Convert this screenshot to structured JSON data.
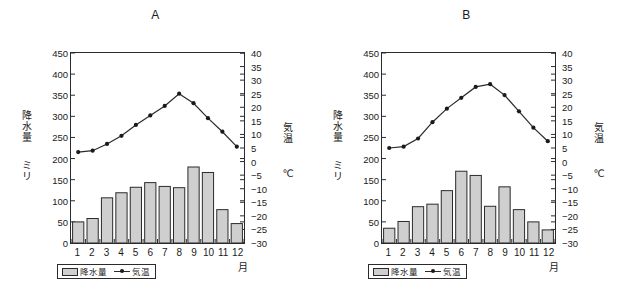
{
  "figure": {
    "xunit_label": "月",
    "legend": {
      "bar_label": "降水量",
      "line_label": "気温"
    },
    "axis_labels": {
      "left_name": "降水量",
      "left_unit": "ミリ",
      "right_name": "気温",
      "right_unit": "℃"
    }
  },
  "chart_data": [
    {
      "type": "bar",
      "title": "A",
      "categories": [
        "1",
        "2",
        "3",
        "4",
        "5",
        "6",
        "7",
        "8",
        "9",
        "10",
        "11",
        "12"
      ],
      "xlabel": "月",
      "ylabel": "降水量",
      "ylim": [
        0,
        450
      ],
      "yticks": [
        0,
        50,
        100,
        150,
        200,
        250,
        300,
        350,
        400,
        450
      ],
      "y2label": "気温",
      "y2lim": [
        -30,
        40
      ],
      "y2ticks": [
        -30,
        -25,
        -20,
        -15,
        -10,
        -5,
        0,
        5,
        10,
        15,
        20,
        25,
        30,
        35,
        40
      ],
      "grid": false,
      "legend_position": "below-axis-left",
      "series": [
        {
          "name": "降水量",
          "kind": "bar",
          "unit": "mm",
          "axis": "left",
          "values": [
            50,
            58,
            107,
            119,
            132,
            143,
            134,
            131,
            180,
            167,
            79,
            46
          ]
        },
        {
          "name": "気温",
          "kind": "line",
          "unit": "℃",
          "axis": "right",
          "values": [
            3.5,
            4.0,
            6.5,
            9.5,
            13.5,
            17.0,
            20.5,
            25.0,
            21.5,
            16.0,
            11.0,
            5.5
          ]
        }
      ]
    },
    {
      "type": "bar",
      "title": "B",
      "categories": [
        "1",
        "2",
        "3",
        "4",
        "5",
        "6",
        "7",
        "8",
        "9",
        "10",
        "11",
        "12"
      ],
      "xlabel": "月",
      "ylabel": "降水量",
      "ylim": [
        0,
        450
      ],
      "yticks": [
        0,
        50,
        100,
        150,
        200,
        250,
        300,
        350,
        400,
        450
      ],
      "y2label": "気温",
      "y2lim": [
        -30,
        40
      ],
      "y2ticks": [
        -30,
        -25,
        -20,
        -15,
        -10,
        -5,
        0,
        5,
        10,
        15,
        20,
        25,
        30,
        35,
        40
      ],
      "grid": false,
      "legend_position": "below-axis-left",
      "series": [
        {
          "name": "降水量",
          "kind": "bar",
          "unit": "mm",
          "axis": "left",
          "values": [
            35,
            51,
            86,
            92,
            124,
            170,
            160,
            87,
            133,
            79,
            50,
            31
          ]
        },
        {
          "name": "気温",
          "kind": "line",
          "unit": "℃",
          "axis": "right",
          "values": [
            5.0,
            5.5,
            8.5,
            14.5,
            19.5,
            23.5,
            27.5,
            28.5,
            24.5,
            18.5,
            12.5,
            7.5
          ]
        }
      ]
    }
  ],
  "style": {
    "bar_fill": "#cfcfcf",
    "bar_stroke": "#2b2b2b",
    "line_color": "#2b2b2b",
    "marker_color": "#1a1a1a",
    "axis_color": "#2b2b2b",
    "text_color": "#1a1a1a"
  }
}
